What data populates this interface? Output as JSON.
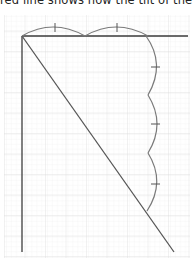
{
  "caption": "red line shows how the tilt of the line",
  "colors": {
    "grid_major": "#dcdcdc",
    "grid_minor": "#efefef",
    "axis": "#3a3a3a",
    "curve": "#7a7a7a",
    "tick": "#555555",
    "background": "#ffffff"
  },
  "diagram": {
    "origin": [
      22,
      36
    ],
    "top_line_end": [
      188,
      36
    ],
    "vertical_line_end": [
      22,
      252
    ],
    "diagonal_end": [
      174,
      252
    ],
    "top_arcs": [
      {
        "from": [
          22,
          36
        ],
        "to": [
          85,
          36
        ],
        "peak_y": 27,
        "tick_x": 55
      },
      {
        "from": [
          85,
          36
        ],
        "to": [
          148,
          36
        ],
        "peak_y": 27,
        "tick_x": 117
      }
    ],
    "right_arcs": [
      {
        "from": [
          148,
          36
        ],
        "to": [
          148,
          95
        ],
        "bulge_x": 157,
        "tick_y": 67
      },
      {
        "from": [
          148,
          95
        ],
        "to": [
          148,
          153
        ],
        "bulge_x": 157,
        "tick_y": 124
      },
      {
        "from": [
          148,
          153
        ],
        "to": [
          147,
          211
        ],
        "bulge_x": 157,
        "tick_y": 184
      }
    ]
  }
}
